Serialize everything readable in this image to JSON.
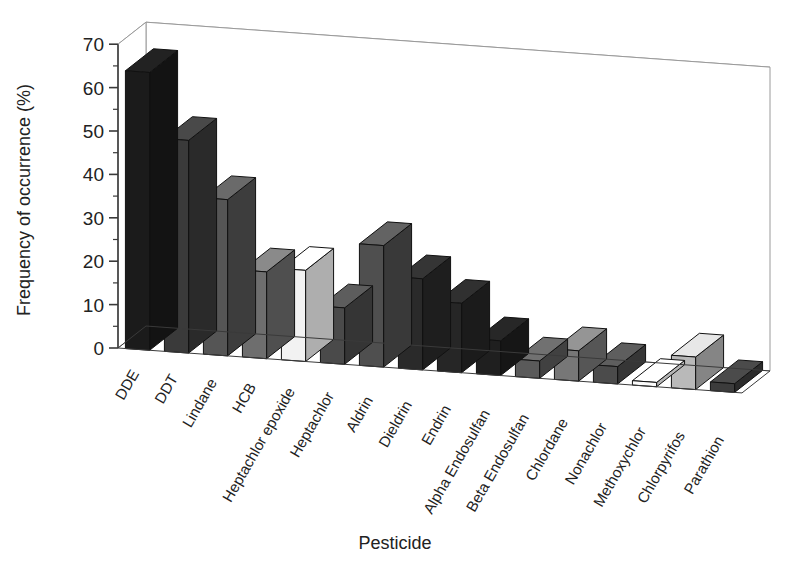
{
  "chart_data": {
    "type": "bar",
    "title": "",
    "subtitle": "",
    "xlabel": "Pesticide",
    "ylabel": "Frequency of occurrence (%)",
    "ylim": [
      0,
      70
    ],
    "ytick_values": [
      0,
      10,
      20,
      30,
      40,
      50,
      60,
      70
    ],
    "ytick_labels": [
      "0",
      "10",
      "20",
      "30",
      "40",
      "50",
      "60",
      "70"
    ],
    "grid": true,
    "legend": "none",
    "projection": "3d-bar",
    "categories": [
      "DDE",
      "DDT",
      "Lindane",
      "HCB",
      "Heptachlor epoxide",
      "Heptachlor",
      "Aldrin",
      "Dieldrin",
      "Endrin",
      "Alpha Endosulfan",
      "Beta Endosulfan",
      "Chlordane",
      "Nonachlor",
      "Methoxychlor",
      "Chlorpyrifos",
      "Parathion"
    ],
    "values": [
      64,
      49,
      36,
      20,
      21,
      13,
      28,
      21,
      16,
      8,
      4,
      7,
      4,
      1,
      7.5,
      2
    ],
    "bar_shades": [
      "#1b1b1b",
      "#3a3a3a",
      "#555555",
      "#6e6e6e",
      "#f2f2f2",
      "#4a4a4a",
      "#4f4f4f",
      "#2a2a2a",
      "#262626",
      "#1f1f1f",
      "#5a5a5a",
      "#777777",
      "#4b4b4b",
      "#fbfbfb",
      "#b9b9b9",
      "#3c3c3c"
    ]
  },
  "colors": {
    "background": "#ffffff",
    "axis": "#3a3a3a",
    "grid": "#9a9a9a",
    "text": "#1a1a1a"
  }
}
